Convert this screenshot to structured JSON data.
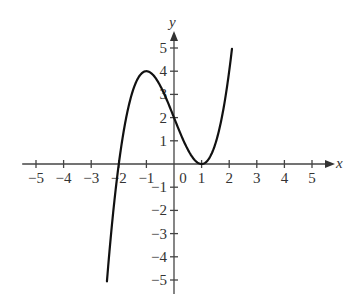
{
  "chart_data": {
    "type": "line",
    "title": "",
    "function": "y = x^3 - 3x + 2",
    "xlabel": "x",
    "ylabel": "y",
    "xlim": [
      -5,
      5
    ],
    "ylim": [
      -5,
      5
    ],
    "grid": false,
    "legend": null,
    "x_ticks": [
      -5,
      -4,
      -3,
      -2,
      -1,
      0,
      1,
      2,
      3,
      4,
      5
    ],
    "y_ticks": [
      -5,
      -4,
      -3,
      -2,
      -1,
      1,
      2,
      3,
      4,
      5
    ],
    "x_tick_labels": [
      "−5",
      "−4",
      "−3",
      "−2",
      "−1",
      "0",
      "1",
      "2",
      "3",
      "4",
      "5"
    ],
    "y_tick_labels": [
      "−5",
      "−4",
      "−3",
      "−2",
      "−1",
      "1",
      "2",
      "3",
      "4",
      "5"
    ],
    "domain": [
      -2.43,
      2.1
    ],
    "series": [
      {
        "name": "f(x)",
        "x": [
          -2.43,
          -2.25,
          -2.0,
          -1.75,
          -1.5,
          -1.25,
          -1.0,
          -0.75,
          -0.5,
          -0.25,
          0.0,
          0.25,
          0.5,
          0.75,
          1.0,
          1.25,
          1.5,
          1.75,
          2.0,
          2.1
        ],
        "y": [
          -5.06,
          -2.64,
          0.0,
          1.89,
          3.13,
          3.8,
          4.0,
          3.83,
          3.38,
          2.73,
          2.0,
          1.27,
          0.63,
          0.17,
          0.0,
          0.2,
          0.88,
          2.11,
          4.0,
          4.96
        ]
      }
    ],
    "key_points": [
      {
        "label": "local max",
        "x": -1,
        "y": 4
      },
      {
        "label": "y-intercept",
        "x": 0,
        "y": 2
      },
      {
        "label": "root",
        "x": -2,
        "y": 0
      },
      {
        "label": "double root / local min",
        "x": 1,
        "y": 0
      }
    ]
  }
}
